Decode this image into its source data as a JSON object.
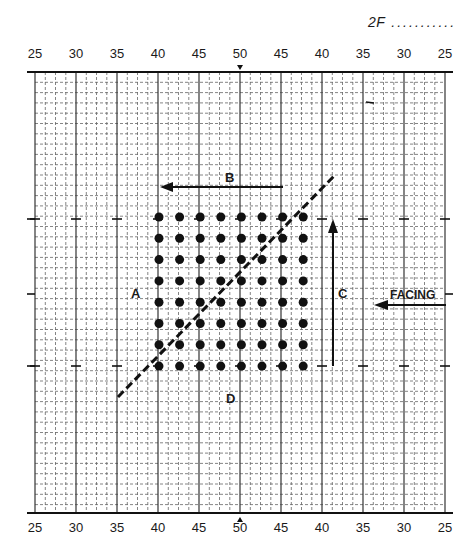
{
  "page_label": {
    "code": "2F",
    "fill_line": "..........."
  },
  "field": {
    "yard_lines_top": [
      "25",
      "30",
      "35",
      "40",
      "45",
      "50",
      "45",
      "40",
      "35",
      "30",
      "25"
    ],
    "yard_lines_bottom": [
      "25",
      "30",
      "35",
      "40",
      "45",
      "50",
      "45",
      "40",
      "35",
      "30",
      "25"
    ],
    "center_marker_top": "v",
    "center_marker_bottom": "^",
    "subdivisions_per_5_yards": 4
  },
  "formation": {
    "columns": 8,
    "rows": 8,
    "dot_count": 64,
    "start_yard_line": "40 (left side)",
    "color": "#111111"
  },
  "labels": {
    "A": "A",
    "B": "B",
    "C": "C",
    "D": "D",
    "facing": "FACING"
  },
  "arrows": [
    {
      "name": "B",
      "direction": "left"
    },
    {
      "name": "C",
      "direction": "up"
    },
    {
      "name": "facing",
      "direction": "left"
    }
  ],
  "diagonal_line": {
    "style": "dashed",
    "direction": "lower-left to upper-right"
  }
}
